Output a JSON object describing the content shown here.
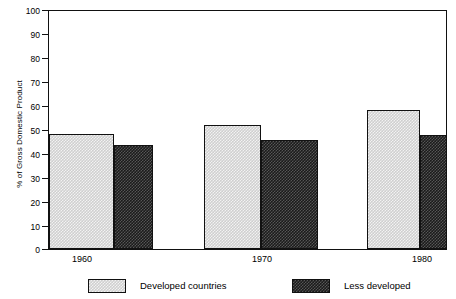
{
  "chart_data": {
    "type": "bar",
    "title": "",
    "xlabel": "",
    "ylabel": "% of Gross Domestic Product",
    "ylim": [
      0,
      100
    ],
    "yticks": [
      0,
      10,
      20,
      30,
      40,
      50,
      60,
      70,
      80,
      90,
      100
    ],
    "ytick_labels": [
      "0",
      "10",
      "20",
      "30",
      "40",
      "50",
      "60",
      "70",
      "80",
      "90",
      "100"
    ],
    "grid": false,
    "legend_position": "bottom",
    "categories": [
      "1960",
      "1970",
      "1980"
    ],
    "series": [
      {
        "name": "Developed countries",
        "values": [
          48.5,
          52,
          58.5
        ],
        "fill": "light-checker",
        "color": "#cfcfcf"
      },
      {
        "name": "Less developed",
        "values": [
          43.5,
          46,
          48
        ],
        "fill": "dark-checker",
        "color": "#1b1b1b"
      }
    ]
  },
  "axis": {
    "y_title": "% of Gross Domestic Product",
    "y_labels": [
      "100",
      "90",
      "80",
      "70",
      "60",
      "50",
      "40",
      "30",
      "20",
      "10",
      "0"
    ],
    "x_labels": [
      "1960",
      "1970",
      "1980"
    ]
  },
  "legend": {
    "entries": [
      {
        "label": "Developed countries",
        "swatch": "light-checker-swatch"
      },
      {
        "label": "Less developed",
        "swatch": "dark-checker-swatch"
      }
    ]
  },
  "colors": {
    "axis": "#111111",
    "series_light": "#cfcfcf",
    "series_dark": "#1b1b1b",
    "background": "#ffffff"
  }
}
